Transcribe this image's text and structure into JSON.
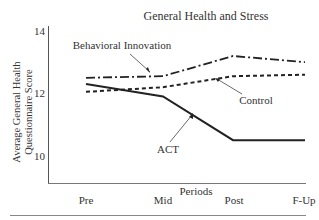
{
  "chart_data": {
    "type": "line",
    "title": "General Health and Stress",
    "xlabel": "Periods",
    "ylabel": [
      "Average General Health",
      "Questionnaire Score"
    ],
    "categories": [
      "Pre",
      "Mid",
      "Post",
      "F-Up"
    ],
    "yticks": [
      "14",
      "12",
      "10"
    ],
    "ylim": [
      9.1,
      14
    ],
    "grid": false,
    "legend": "inline annotations with arrows",
    "series": [
      {
        "name": "Behavioral Innovation",
        "style": "dash-dot",
        "values": [
          12.5,
          12.55,
          13.2,
          13.0
        ]
      },
      {
        "name": "Control",
        "style": "dashed",
        "values": [
          12.05,
          12.2,
          12.55,
          12.6
        ]
      },
      {
        "name": "ACT",
        "style": "solid",
        "values": [
          12.3,
          11.9,
          10.5,
          10.5
        ]
      }
    ],
    "annotations": [
      "Behavioral Innovation",
      "Control",
      "ACT"
    ]
  }
}
